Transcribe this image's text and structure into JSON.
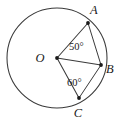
{
  "figure": {
    "kind": "circle-with-two-central-angles",
    "points": [
      {
        "name": "O",
        "role": "center",
        "label": "O",
        "x": 57,
        "y": 58,
        "label_x": 40,
        "label_y": 62
      },
      {
        "name": "A",
        "role": "on-circle",
        "label": "A",
        "x": 88,
        "y": 23,
        "label_x": 90,
        "label_y": 14
      },
      {
        "name": "B",
        "role": "on-circle",
        "label": "B",
        "x": 101,
        "y": 65,
        "label_x": 106,
        "label_y": 73
      },
      {
        "name": "C",
        "role": "on-circle",
        "label": "C",
        "x": 79,
        "y": 98,
        "label_x": 78,
        "label_y": 117
      }
    ],
    "circle": {
      "cx": 57,
      "cy": 58,
      "r": 50
    },
    "radii": [
      {
        "name": "radius-OA",
        "from": "O",
        "to": "A"
      },
      {
        "name": "radius-OB",
        "from": "O",
        "to": "B"
      },
      {
        "name": "radius-OC",
        "from": "O",
        "to": "C"
      }
    ],
    "chords": [
      {
        "name": "chord-AB",
        "from": "A",
        "to": "B"
      },
      {
        "name": "chord-BC",
        "from": "B",
        "to": "C"
      }
    ],
    "angles": [
      {
        "name": "angle-AOB",
        "value": "50°",
        "vertex": "O",
        "rays": [
          "A",
          "B"
        ],
        "label_x": 69,
        "label_y": 50
      },
      {
        "name": "angle-BOC",
        "value": "60°",
        "vertex": "O",
        "rays": [
          "B",
          "C"
        ],
        "label_x": 67,
        "label_y": 86
      }
    ],
    "colors": {
      "stroke": "#3a3a3a",
      "label": "#1a1a1a",
      "background": "#ffffff"
    }
  }
}
